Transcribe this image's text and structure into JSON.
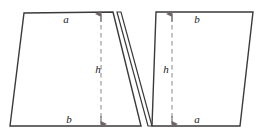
{
  "figure": {
    "background_color": "#ffffff",
    "stroke_color": "#3a3a3a",
    "dash_color": "#9a8f94",
    "label_color": "#1a1a1a",
    "shapes": [
      {
        "name": "left-trapezoid",
        "points": "24,13 113,12 141,126 10,126",
        "description": "Left trapezoid, shorter side a on top, longer side b on bottom"
      },
      {
        "name": "cut-sliver-triangle",
        "points": "117,12 148,126 152,126 121,12",
        "description": "Thin sliver between the two trapezoids showing the cut"
      },
      {
        "name": "right-trapezoid",
        "points": "152,126 240,126 253,12 156,12",
        "description": "Right trapezoid, longer side b on top, shorter side a on bottom"
      }
    ],
    "measure_lines": [
      {
        "name": "left-height-arrow",
        "x": 101,
        "y_top": 14,
        "y_bottom": 124,
        "label": "h"
      },
      {
        "name": "right-height-arrow",
        "x": 172,
        "y_top": 14,
        "y_bottom": 124,
        "label": "h"
      }
    ],
    "labels": [
      {
        "name": "label-a-top-left",
        "text": "a",
        "x": 66,
        "y": 19
      },
      {
        "name": "label-b-bottom-left",
        "text": "b",
        "x": 69,
        "y": 119
      },
      {
        "name": "label-h-left",
        "text": "h",
        "x": 98,
        "y": 69
      },
      {
        "name": "label-h-right",
        "text": "h",
        "x": 166,
        "y": 69
      },
      {
        "name": "label-b-top-right",
        "text": "b",
        "x": 197,
        "y": 19
      },
      {
        "name": "label-a-bottom-right",
        "text": "a",
        "x": 197,
        "y": 119
      }
    ]
  }
}
